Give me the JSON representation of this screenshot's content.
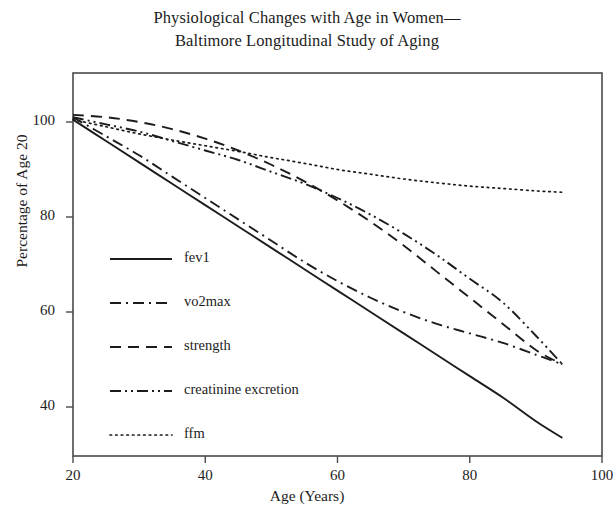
{
  "chart_data": {
    "type": "line",
    "title_line1": "Physiological Changes with Age in Women—",
    "title_line2": "Baltimore Longitudinal Study of Aging",
    "xlabel": "Age (Years)",
    "ylabel": "Percentage of Age 20",
    "xlim": [
      20,
      100
    ],
    "ylim": [
      30,
      110
    ],
    "xticks": [
      20,
      40,
      60,
      80,
      100
    ],
    "xtick_labels": [
      "20",
      "40",
      "60",
      "80",
      "100"
    ],
    "yticks": [
      40,
      60,
      80,
      100
    ],
    "ytick_labels": [
      "40",
      "60",
      "80",
      "100"
    ],
    "grid": false,
    "legend_position": "center-left-inside",
    "line_color": "#1c1c1c",
    "series": [
      {
        "name": "fev1",
        "style": "solid",
        "x": [
          20,
          25,
          30,
          35,
          40,
          45,
          50,
          55,
          60,
          65,
          70,
          75,
          80,
          85,
          90,
          94
        ],
        "y": [
          100.5,
          96.0,
          91.5,
          87.0,
          82.5,
          78.0,
          73.5,
          69.0,
          64.5,
          60.0,
          55.5,
          51.0,
          46.5,
          42.0,
          37.0,
          33.5
        ]
      },
      {
        "name": "vo2max",
        "style": "dashdot",
        "x": [
          20,
          25,
          30,
          35,
          40,
          45,
          50,
          55,
          60,
          65,
          70,
          75,
          80,
          85,
          90,
          94
        ],
        "y": [
          101.0,
          97.0,
          93.0,
          88.5,
          84.0,
          79.5,
          75.0,
          70.5,
          66.5,
          63.0,
          60.0,
          57.5,
          55.5,
          53.5,
          51.0,
          49.0
        ]
      },
      {
        "name": "strength",
        "style": "dashed",
        "x": [
          20,
          25,
          30,
          35,
          40,
          45,
          50,
          55,
          60,
          65,
          70,
          75,
          80,
          85,
          90,
          94
        ],
        "y": [
          101.5,
          101.0,
          100.0,
          98.5,
          96.5,
          94.0,
          91.0,
          87.5,
          83.5,
          79.0,
          74.0,
          68.5,
          63.0,
          57.5,
          52.0,
          49.0
        ]
      },
      {
        "name": "creatinine excretion",
        "style": "dashdotdot",
        "x": [
          20,
          25,
          30,
          35,
          40,
          45,
          50,
          55,
          60,
          65,
          70,
          75,
          80,
          85,
          90,
          94
        ],
        "y": [
          101.0,
          99.5,
          98.0,
          96.0,
          94.0,
          92.0,
          89.5,
          87.0,
          84.0,
          80.5,
          76.5,
          72.0,
          67.0,
          62.0,
          55.0,
          49.0
        ]
      },
      {
        "name": "ffm",
        "style": "dotted",
        "x": [
          20,
          25,
          30,
          35,
          40,
          45,
          50,
          55,
          60,
          65,
          70,
          75,
          80,
          85,
          90,
          94
        ],
        "y": [
          100.5,
          99.0,
          97.5,
          96.2,
          95.0,
          93.8,
          92.5,
          91.3,
          90.0,
          89.0,
          88.0,
          87.2,
          86.5,
          86.0,
          85.5,
          85.2
        ]
      }
    ],
    "legend_entries": [
      {
        "label": "fev1",
        "style": "solid"
      },
      {
        "label": "vo2max",
        "style": "dashdot"
      },
      {
        "label": "strength",
        "style": "dashed"
      },
      {
        "label": "creatinine excretion",
        "style": "dashdotdot"
      },
      {
        "label": "ffm",
        "style": "dotted"
      }
    ]
  }
}
